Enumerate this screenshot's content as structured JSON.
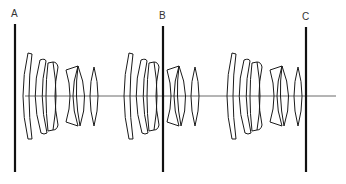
{
  "diagram": {
    "title": "",
    "labels": [
      {
        "id": "A",
        "text": "A",
        "x": 14,
        "y": 9
      },
      {
        "id": "B",
        "text": "B",
        "x": 160,
        "y": 12
      },
      {
        "id": "C",
        "text": "C",
        "x": 303,
        "y": 13
      }
    ],
    "planes": [
      {
        "id": "A",
        "x": 15,
        "y1": 24,
        "y2": 172
      },
      {
        "id": "B",
        "x": 163,
        "y1": 26,
        "y2": 172
      },
      {
        "id": "C",
        "x": 306,
        "y1": 27,
        "y2": 172
      }
    ],
    "axis": {
      "x1": 25,
      "x2": 336,
      "y": 96
    },
    "lens_groups": [
      {
        "offset_x": 0
      },
      {
        "offset_x": 101
      },
      {
        "offset_x": 204
      }
    ],
    "colors": {
      "line": "#1a1a1a",
      "plane": "#111111",
      "axis": "#444444",
      "label": "#333333"
    }
  }
}
